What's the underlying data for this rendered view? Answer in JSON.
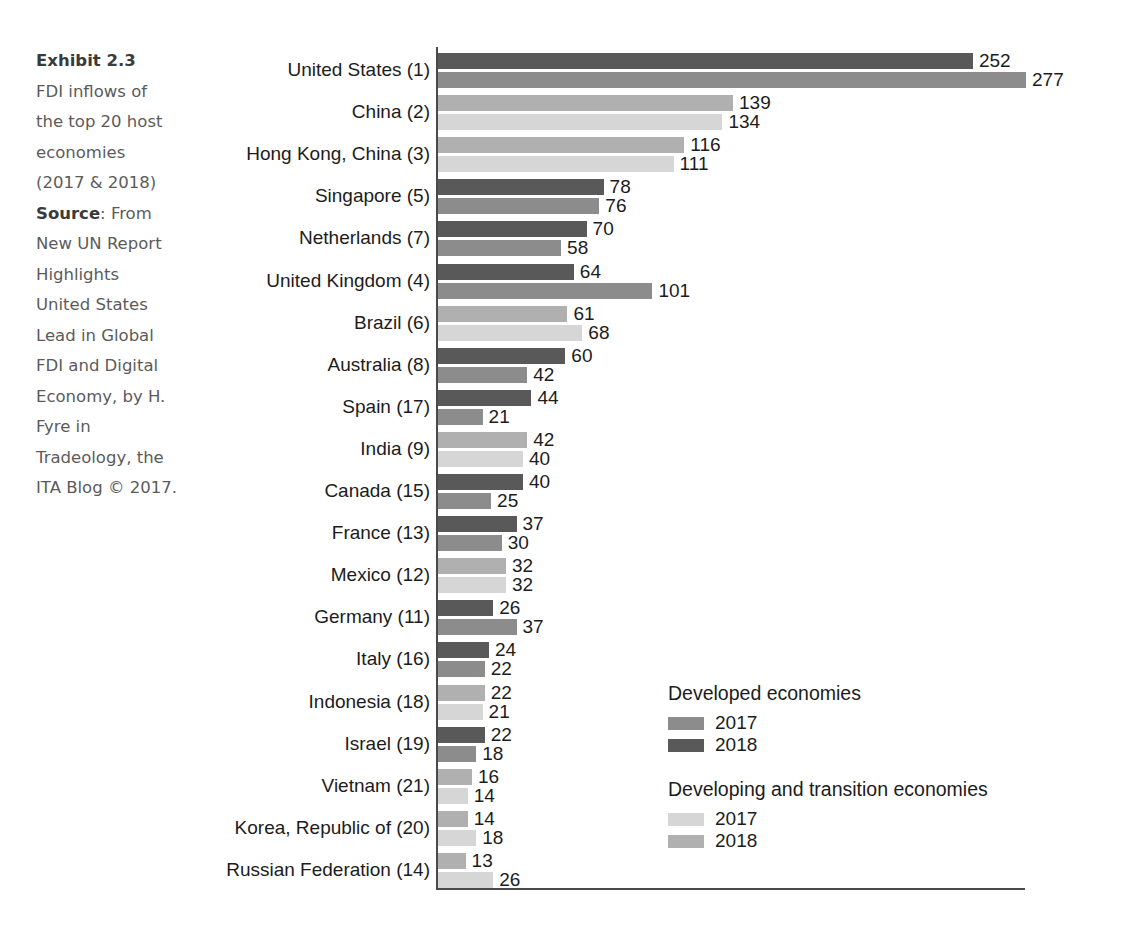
{
  "caption": {
    "exhibit_title": "Exhibit 2.3",
    "description": "FDI inflows of the top 20 host economies (2017 & 2018)",
    "source_label": "Source",
    "source_text": ": From New UN Report Highlights United States Lead in Global FDI and Digital Economy, by H. Fyre in Tradeology, the ITA Blog © 2017."
  },
  "legend": {
    "groups": [
      {
        "heading": "Developed economies",
        "entries": [
          {
            "label": "2017",
            "color": "#8c8c8c"
          },
          {
            "label": "2018",
            "color": "#595959"
          }
        ]
      },
      {
        "heading": "Developing and transition economies",
        "entries": [
          {
            "label": "2017",
            "color": "#d6d6d6"
          },
          {
            "label": "2018",
            "color": "#b0b0b0"
          }
        ]
      }
    ]
  },
  "chart_data": {
    "type": "bar",
    "orientation": "horizontal",
    "title": "FDI inflows of the top 20 host economies (2017 & 2018)",
    "xlabel": "",
    "ylabel": "",
    "xlim": [
      0,
      290
    ],
    "grid": false,
    "legend_position": "inside-bottom-right",
    "value_unit": "billions of US dollars",
    "categories": [
      "United States (1)",
      "China (2)",
      "Hong Kong, China (3)",
      "Singapore (5)",
      "Netherlands (7)",
      "United Kingdom (4)",
      "Brazil (6)",
      "Australia (8)",
      "Spain (17)",
      "India (9)",
      "Canada (15)",
      "France (13)",
      "Mexico (12)",
      "Germany (11)",
      "Italy (16)",
      "Indonesia (18)",
      "Israel (19)",
      "Vietnam (21)",
      "Korea, Republic of (20)",
      "Russian Federation (14)"
    ],
    "group_types": [
      "developed",
      "developing",
      "developing",
      "developed",
      "developed",
      "developed",
      "developing",
      "developed",
      "developed",
      "developing",
      "developed",
      "developed",
      "developing",
      "developed",
      "developed",
      "developing",
      "developed",
      "developing",
      "developing",
      "developing"
    ],
    "series": [
      {
        "name": "2018",
        "values": [
          252,
          139,
          116,
          78,
          70,
          64,
          61,
          60,
          44,
          42,
          40,
          37,
          32,
          26,
          24,
          22,
          22,
          16,
          14,
          13
        ]
      },
      {
        "name": "2017",
        "values": [
          277,
          134,
          111,
          76,
          58,
          101,
          68,
          42,
          21,
          40,
          25,
          30,
          32,
          37,
          22,
          21,
          18,
          14,
          18,
          26
        ]
      }
    ]
  }
}
